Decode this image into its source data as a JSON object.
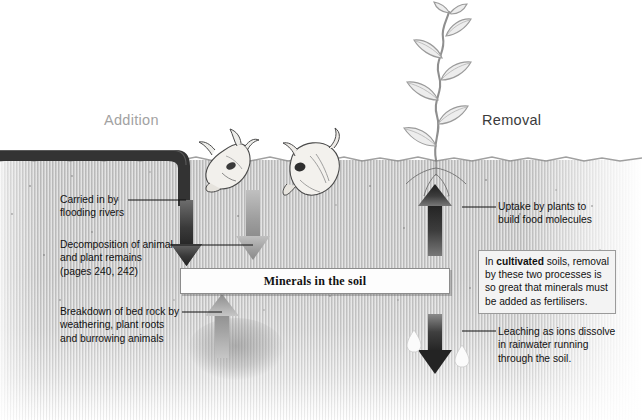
{
  "figure": {
    "title_left": "Addition",
    "title_right": "Removal",
    "center_label": "Minerals in the soil"
  },
  "callouts": [
    {
      "id": "flooding-rivers",
      "text": "Carried in by\nflooding rivers"
    },
    {
      "id": "decomposition",
      "text": "Decomposition of animal\nand plant remains\n(pages 240, 242)"
    },
    {
      "id": "bed-rock-breakdown",
      "text": "Breakdown of bed rock by\nweathering, plant roots\nand burrowing animals"
    },
    {
      "id": "plant-uptake",
      "text": "Uptake by plants to\nbuild food molecules"
    },
    {
      "id": "leaching",
      "text": "Leaching as ions dissolve\nin rainwater running\nthrough the soil."
    }
  ],
  "note": {
    "part1": "In ",
    "emphasis": "cultivated",
    "part2": " soils, removal by these two processes is so great that minerals must be added as fertilisers."
  },
  "icons": {
    "plant": "plant-seedling-icon",
    "skull_left": "animal-skull-icon",
    "skull_right": "animal-skull-icon",
    "droplet_left": "water-droplet-icon",
    "droplet_right": "water-droplet-icon",
    "river": "river-band-icon",
    "arrow_river": "arrow-down-icon",
    "arrow_decomposition": "arrow-down-icon",
    "arrow_bedrock": "arrow-up-icon",
    "arrow_uptake": "arrow-up-icon",
    "arrow_leaching": "arrow-down-icon"
  },
  "colors": {
    "soil": "#c5c5c5",
    "arrow_dark": "#2f2f2f",
    "arrow_light": "#a6a6a6",
    "river": "#333333",
    "heading_left": "#a2a2a2",
    "heading_right": "#3b3b3b",
    "note_bg": "#f3f3f3",
    "bar_bg": "#fdfdfd"
  }
}
